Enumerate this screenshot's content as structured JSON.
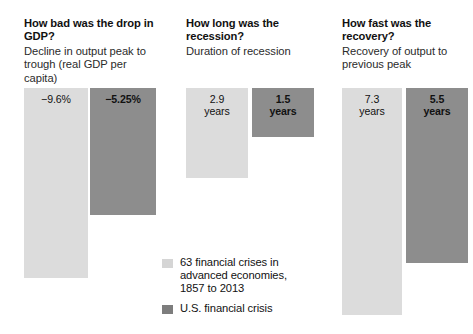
{
  "chart_data": {
    "type": "bar",
    "title": "",
    "orientation": "downward",
    "panels": [
      {
        "heading": "How bad was the drop in GDP?",
        "subtitle": "Decline in output peak to trough (real GDP per capita)",
        "unit": "percent",
        "categories": [
          "63 financial crises in advanced economies, 1857 to 2013",
          "U.S. financial crisis"
        ],
        "values": [
          -9.6,
          -5.25
        ],
        "labels": [
          "−9.6%",
          "−5.25%"
        ]
      },
      {
        "heading": "How long was the recession?",
        "subtitle": "Duration of recession",
        "unit": "years",
        "categories": [
          "63 financial crises in advanced economies, 1857 to 2013",
          "U.S. financial crisis"
        ],
        "values": [
          2.9,
          1.5
        ],
        "labels": [
          "2.9\nyears",
          "1.5\nyears"
        ]
      },
      {
        "heading": "How fast was the recovery?",
        "subtitle": "Recovery of output to previous peak",
        "unit": "years",
        "categories": [
          "63 financial crises in advanced economies, 1857 to 2013",
          "U.S. financial crisis"
        ],
        "values": [
          7.3,
          5.5
        ],
        "labels": [
          "7.3\nyears",
          "5.5\nyears"
        ]
      }
    ],
    "legend": {
      "position": "bottom-center",
      "entries": [
        {
          "label": "63 financial crises in advanced economies, 1857 to 2013",
          "color": "#d5d5d5"
        },
        {
          "label": "U.S. financial crisis",
          "color": "#7d7d7d"
        }
      ]
    },
    "grid": false,
    "colors": {
      "series_light": "#dcdcdc",
      "series_dark": "#8d8d8d",
      "background": "#ffffff",
      "text": "#111111"
    }
  },
  "panels": [
    {
      "heading": "How bad was the drop in GDP?",
      "subtitle": "Decline in output peak to trough (real GDP per capita)",
      "light_label": "−9.6%",
      "dark_label": "−5.25%"
    },
    {
      "heading": "How long was the recession?",
      "subtitle": "Duration of recession",
      "light_label_value": "2.9",
      "light_label_unit": "years",
      "dark_label_value": "1.5",
      "dark_label_unit": "years"
    },
    {
      "heading": "How fast was the recovery?",
      "subtitle": "Recovery of output to previous peak",
      "light_label_value": "7.3",
      "light_label_unit": "years",
      "dark_label_value": "5.5",
      "dark_label_unit": "years"
    }
  ],
  "legend": {
    "light_line1": "63 financial crises in",
    "light_line2": "advanced economies,",
    "light_line3": "1857 to 2013",
    "dark_line1": "U.S. financial crisis"
  }
}
